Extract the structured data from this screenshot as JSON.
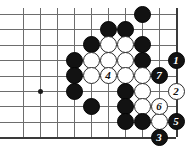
{
  "figure": {
    "type": "go-board-diagram",
    "width": 196,
    "height": 155,
    "background_color": "#ffffff"
  },
  "board": {
    "columns": 10,
    "rows": 9,
    "origin_x": 23,
    "origin_y": 14,
    "col_spacing": 17,
    "row_spacing": 15.4,
    "line_color": "#6d6d6d",
    "edge_color": "#3a3a3a",
    "right_edge_col": 9,
    "bottom_edge_row": 8,
    "star_points": [
      {
        "col": 1,
        "row": 5
      }
    ]
  },
  "colors": {
    "black_stone": "#121212",
    "white_stone": "#ffffff",
    "black_label": "#ffffff",
    "white_label": "#111111"
  },
  "stones": [
    {
      "col": 7,
      "row": 0,
      "color": "black",
      "label": ""
    },
    {
      "col": 5,
      "row": 1,
      "color": "black",
      "label": ""
    },
    {
      "col": 6,
      "row": 1,
      "color": "black",
      "label": ""
    },
    {
      "col": 4,
      "row": 2,
      "color": "black",
      "label": ""
    },
    {
      "col": 5,
      "row": 2,
      "color": "white",
      "label": ""
    },
    {
      "col": 6,
      "row": 2,
      "color": "white",
      "label": ""
    },
    {
      "col": 7,
      "row": 2,
      "color": "black",
      "label": ""
    },
    {
      "col": 3,
      "row": 3,
      "color": "black",
      "label": ""
    },
    {
      "col": 4,
      "row": 3,
      "color": "white",
      "label": ""
    },
    {
      "col": 5,
      "row": 3,
      "color": "white",
      "label": ""
    },
    {
      "col": 6,
      "row": 3,
      "color": "white",
      "label": ""
    },
    {
      "col": 7,
      "row": 3,
      "color": "black",
      "label": ""
    },
    {
      "col": 9,
      "row": 3,
      "color": "black",
      "label": "1"
    },
    {
      "col": 3,
      "row": 4,
      "color": "black",
      "label": ""
    },
    {
      "col": 4,
      "row": 4,
      "color": "white",
      "label": ""
    },
    {
      "col": 5,
      "row": 4,
      "color": "white",
      "label": "4"
    },
    {
      "col": 6,
      "row": 4,
      "color": "white",
      "label": ""
    },
    {
      "col": 7,
      "row": 4,
      "color": "white",
      "label": ""
    },
    {
      "col": 8,
      "row": 4,
      "color": "black",
      "label": "7"
    },
    {
      "col": 3,
      "row": 5,
      "color": "black",
      "label": ""
    },
    {
      "col": 6,
      "row": 5,
      "color": "black",
      "label": ""
    },
    {
      "col": 7,
      "row": 5,
      "color": "white",
      "label": ""
    },
    {
      "col": 9,
      "row": 5,
      "color": "white",
      "label": "2"
    },
    {
      "col": 4,
      "row": 6,
      "color": "black",
      "label": ""
    },
    {
      "col": 6,
      "row": 6,
      "color": "black",
      "label": ""
    },
    {
      "col": 7,
      "row": 6,
      "color": "white",
      "label": ""
    },
    {
      "col": 8,
      "row": 6,
      "color": "white",
      "label": "6"
    },
    {
      "col": 6,
      "row": 7,
      "color": "black",
      "label": ""
    },
    {
      "col": 7,
      "row": 7,
      "color": "black",
      "label": ""
    },
    {
      "col": 8,
      "row": 7,
      "color": "white",
      "label": ""
    },
    {
      "col": 9,
      "row": 7,
      "color": "black",
      "label": "5"
    },
    {
      "col": 8,
      "row": 8,
      "color": "black",
      "label": "3"
    }
  ],
  "move_sequence": [
    {
      "number": "1",
      "color": "black"
    },
    {
      "number": "2",
      "color": "white"
    },
    {
      "number": "3",
      "color": "black"
    },
    {
      "number": "4",
      "color": "white"
    },
    {
      "number": "5",
      "color": "black"
    },
    {
      "number": "6",
      "color": "white"
    },
    {
      "number": "7",
      "color": "black"
    }
  ]
}
